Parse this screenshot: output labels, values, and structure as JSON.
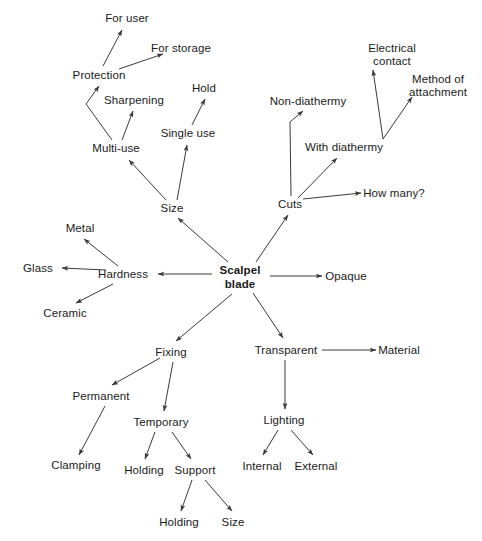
{
  "diagram": {
    "type": "mind-map",
    "title": "Scalpel blade",
    "background_color": "#ffffff",
    "text_color": "#1a1a1a",
    "edge_color": "#3a3a3a",
    "nodes": [
      {
        "id": "root",
        "label": "Scalpel\nblade",
        "x": 240,
        "y": 277,
        "bold": true
      },
      {
        "id": "size",
        "label": "Size",
        "x": 172,
        "y": 208
      },
      {
        "id": "multi-use",
        "label": "Multi-use",
        "x": 116,
        "y": 148
      },
      {
        "id": "protection",
        "label": "Protection",
        "x": 99,
        "y": 75
      },
      {
        "id": "for-user",
        "label": "For user",
        "x": 127,
        "y": 18
      },
      {
        "id": "for-storage",
        "label": "For storage",
        "x": 181,
        "y": 48
      },
      {
        "id": "sharpening",
        "label": "Sharpening",
        "x": 134,
        "y": 100
      },
      {
        "id": "single-use",
        "label": "Single use",
        "x": 188,
        "y": 133
      },
      {
        "id": "hold",
        "label": "Hold",
        "x": 204,
        "y": 88
      },
      {
        "id": "cuts",
        "label": "Cuts",
        "x": 290,
        "y": 204
      },
      {
        "id": "non-diathermy",
        "label": "Non-diathermy",
        "x": 308,
        "y": 101
      },
      {
        "id": "with-diathermy",
        "label": "With diathermy",
        "x": 344,
        "y": 147
      },
      {
        "id": "how-many",
        "label": "How many?",
        "x": 394,
        "y": 193
      },
      {
        "id": "electrical",
        "label": "Electrical\ncontact",
        "x": 392,
        "y": 55
      },
      {
        "id": "method",
        "label": "Method of\nattachment",
        "x": 438,
        "y": 86
      },
      {
        "id": "hardness",
        "label": "Hardness",
        "x": 123,
        "y": 274
      },
      {
        "id": "metal",
        "label": "Metal",
        "x": 80,
        "y": 228
      },
      {
        "id": "glass",
        "label": "Glass",
        "x": 38,
        "y": 268
      },
      {
        "id": "ceramic",
        "label": "Ceramic",
        "x": 65,
        "y": 313
      },
      {
        "id": "opaque",
        "label": "Opaque",
        "x": 346,
        "y": 276
      },
      {
        "id": "fixing",
        "label": "Fixing",
        "x": 171,
        "y": 352
      },
      {
        "id": "permanent",
        "label": "Permanent",
        "x": 101,
        "y": 396
      },
      {
        "id": "temporary",
        "label": "Temporary",
        "x": 161,
        "y": 422
      },
      {
        "id": "clamping",
        "label": "Clamping",
        "x": 76,
        "y": 465
      },
      {
        "id": "holding-1",
        "label": "Holding",
        "x": 144,
        "y": 470
      },
      {
        "id": "support",
        "label": "Support",
        "x": 195,
        "y": 470
      },
      {
        "id": "holding-2",
        "label": "Holding",
        "x": 179,
        "y": 522
      },
      {
        "id": "size-2",
        "label": "Size",
        "x": 233,
        "y": 522
      },
      {
        "id": "transparent",
        "label": "Transparent",
        "x": 286,
        "y": 350
      },
      {
        "id": "material",
        "label": "Material",
        "x": 399,
        "y": 350
      },
      {
        "id": "lighting",
        "label": "Lighting",
        "x": 284,
        "y": 420
      },
      {
        "id": "internal",
        "label": "Internal",
        "x": 262,
        "y": 466
      },
      {
        "id": "external",
        "label": "External",
        "x": 316,
        "y": 466
      }
    ],
    "edges": [
      {
        "from": "root",
        "to": "size",
        "points": "228,262 178,218"
      },
      {
        "from": "root",
        "to": "cuts",
        "points": "256,262 288,215"
      },
      {
        "from": "root",
        "to": "hardness",
        "points": "212,274 158,274"
      },
      {
        "from": "root",
        "to": "opaque",
        "points": "270,276 322,276"
      },
      {
        "from": "root",
        "to": "fixing",
        "points": "232,294 176,341"
      },
      {
        "from": "root",
        "to": "transparent",
        "points": "253,293 283,338"
      },
      {
        "from": "size",
        "to": "multi-use",
        "points": "166,200 129,160"
      },
      {
        "from": "size",
        "to": "single-use",
        "points": "177,200 187,145"
      },
      {
        "from": "multi-use",
        "to": "protection",
        "points": "112,140 86,104 99,86"
      },
      {
        "from": "multi-use",
        "to": "sharpening",
        "points": "122,140 133,111"
      },
      {
        "from": "protection",
        "to": "for-user",
        "points": "103,66 122,30"
      },
      {
        "from": "protection",
        "to": "for-storage",
        "points": "119,69 163,54"
      },
      {
        "from": "single-use",
        "to": "hold",
        "points": "192,125 205,99"
      },
      {
        "from": "cuts",
        "to": "non-diathermy",
        "points": "291,196 290,122 303,111"
      },
      {
        "from": "cuts",
        "to": "with-diathermy",
        "points": "298,198 337,158"
      },
      {
        "from": "cuts",
        "to": "how-many",
        "points": "303,199 361,193"
      },
      {
        "from": "with-diathermy",
        "to": "electrical",
        "points": "383,139 373,70"
      },
      {
        "from": "with-diathermy",
        "to": "method",
        "points": "383,139 412,97"
      },
      {
        "from": "hardness",
        "to": "metal",
        "points": "118,266 84,239"
      },
      {
        "from": "hardness",
        "to": "glass",
        "points": "106,270 62,268"
      },
      {
        "from": "hardness",
        "to": "ceramic",
        "points": "113,284 76,303"
      },
      {
        "from": "fixing",
        "to": "permanent",
        "points": "160,358 112,385"
      },
      {
        "from": "fixing",
        "to": "temporary",
        "points": "173,362 164,411"
      },
      {
        "from": "permanent",
        "to": "clamping",
        "points": "105,406 79,455"
      },
      {
        "from": "temporary",
        "to": "holding-1",
        "points": "155,432 145,459"
      },
      {
        "from": "temporary",
        "to": "support",
        "points": "172,432 191,459"
      },
      {
        "from": "support",
        "to": "holding-2",
        "points": "192,480 181,511"
      },
      {
        "from": "support",
        "to": "size-2",
        "points": "205,480 232,511"
      },
      {
        "from": "transparent",
        "to": "material",
        "points": "322,350 376,350"
      },
      {
        "from": "transparent",
        "to": "lighting",
        "points": "285,360 285,409"
      },
      {
        "from": "lighting",
        "to": "internal",
        "points": "278,430 263,455"
      },
      {
        "from": "lighting",
        "to": "external",
        "points": "291,430 313,455"
      }
    ]
  }
}
